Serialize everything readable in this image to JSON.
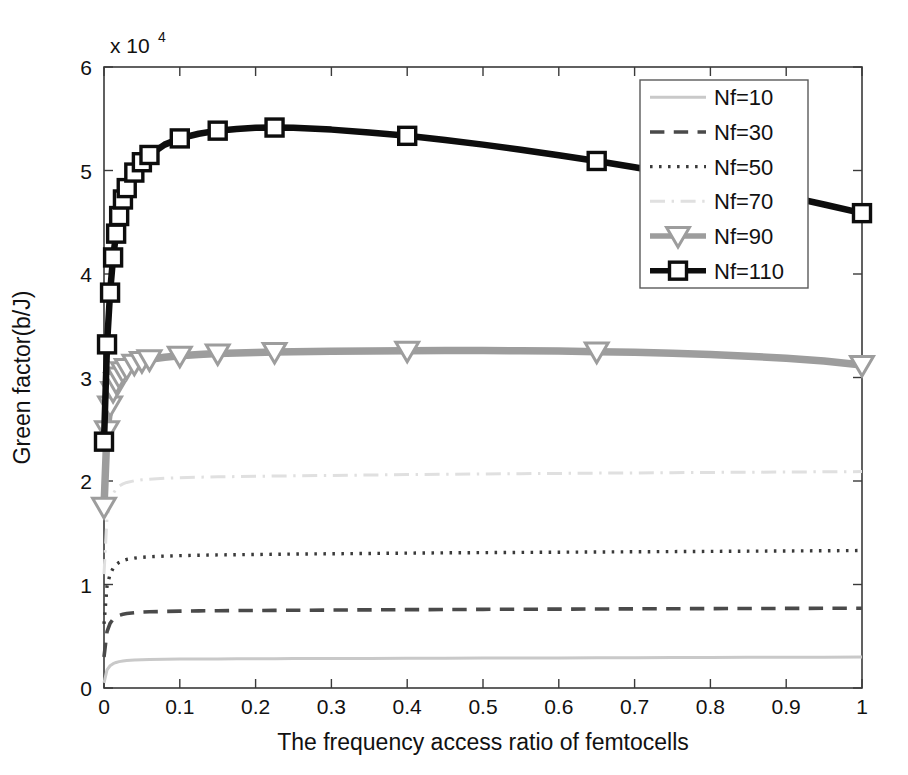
{
  "chart_data": {
    "type": "line",
    "title": "",
    "xlabel": "The frequency access ratio of femtocells",
    "ylabel": "Green factor(b/J)",
    "y_exponent_label": "x 10",
    "y_exponent_power": "4",
    "y_scale_factor": 10000,
    "xlim": [
      0,
      1
    ],
    "ylim": [
      0,
      6
    ],
    "xticks": [
      "0",
      "0.1",
      "0.2",
      "0.3",
      "0.4",
      "0.5",
      "0.6",
      "0.7",
      "0.8",
      "0.9",
      "1"
    ],
    "xtick_values": [
      0,
      0.1,
      0.2,
      0.3,
      0.4,
      0.5,
      0.6,
      0.7,
      0.8,
      0.9,
      1
    ],
    "yticks": [
      "0",
      "1",
      "2",
      "3",
      "4",
      "5",
      "6"
    ],
    "ytick_values": [
      0,
      1,
      2,
      3,
      4,
      5,
      6
    ],
    "grid": false,
    "legend_position": "upper right",
    "x": [
      0,
      0.004,
      0.008,
      0.012,
      0.016,
      0.02,
      0.025,
      0.03,
      0.04,
      0.05,
      0.06,
      0.08,
      0.1,
      0.125,
      0.15,
      0.175,
      0.2,
      0.225,
      0.25,
      0.3,
      0.35,
      0.4,
      0.45,
      0.5,
      0.55,
      0.6,
      0.65,
      0.7,
      0.75,
      0.8,
      0.85,
      0.9,
      0.95,
      1.0
    ],
    "series": [
      {
        "name": "Nf=10",
        "label": "Nf=10",
        "style": "solid",
        "color": "#c9c9c9",
        "width": 3.0,
        "marker": "none",
        "values": [
          0.05,
          0.175,
          0.215,
          0.235,
          0.247,
          0.255,
          0.261,
          0.265,
          0.27,
          0.273,
          0.275,
          0.277,
          0.279,
          0.28,
          0.281,
          0.282,
          0.283,
          0.283,
          0.284,
          0.285,
          0.286,
          0.287,
          0.288,
          0.289,
          0.29,
          0.291,
          0.292,
          0.293,
          0.294,
          0.295,
          0.296,
          0.297,
          0.298,
          0.299
        ]
      },
      {
        "name": "Nf=30",
        "label": "Nf=30",
        "style": "dashed",
        "color": "#4a4a4a",
        "width": 3.6,
        "marker": "none",
        "values": [
          0.3,
          0.545,
          0.625,
          0.665,
          0.688,
          0.702,
          0.713,
          0.72,
          0.728,
          0.733,
          0.736,
          0.74,
          0.743,
          0.745,
          0.747,
          0.748,
          0.749,
          0.75,
          0.751,
          0.753,
          0.755,
          0.757,
          0.758,
          0.76,
          0.761,
          0.762,
          0.763,
          0.765,
          0.766,
          0.767,
          0.768,
          0.769,
          0.77,
          0.771
        ]
      },
      {
        "name": "Nf=50",
        "label": "Nf=50",
        "style": "dotted",
        "color": "#3a3a3a",
        "width": 3.4,
        "marker": "none",
        "values": [
          0.62,
          0.985,
          1.098,
          1.158,
          1.192,
          1.213,
          1.231,
          1.242,
          1.255,
          1.263,
          1.268,
          1.274,
          1.279,
          1.283,
          1.286,
          1.288,
          1.29,
          1.292,
          1.294,
          1.297,
          1.3,
          1.303,
          1.306,
          1.308,
          1.31,
          1.312,
          1.314,
          1.316,
          1.318,
          1.32,
          1.322,
          1.324,
          1.326,
          1.328
        ]
      },
      {
        "name": "Nf=70",
        "label": "Nf=70",
        "style": "dashdot",
        "color": "#e0e0e0",
        "width": 3.0,
        "marker": "none",
        "values": [
          1.1,
          1.645,
          1.798,
          1.878,
          1.923,
          1.95,
          1.972,
          1.986,
          2.002,
          2.012,
          2.018,
          2.026,
          2.032,
          2.037,
          2.04,
          2.043,
          2.046,
          2.048,
          2.05,
          2.054,
          2.058,
          2.062,
          2.065,
          2.068,
          2.071,
          2.073,
          2.076,
          2.078,
          2.08,
          2.083,
          2.085,
          2.087,
          2.089,
          2.091
        ]
      },
      {
        "name": "Nf=90",
        "label": "Nf=90",
        "style": "solid",
        "color": "#9d9d9d",
        "width": 7.5,
        "marker": "triangle-down",
        "values": [
          1.75,
          2.49,
          2.73,
          2.87,
          2.955,
          3.01,
          3.06,
          3.092,
          3.133,
          3.158,
          3.175,
          3.196,
          3.21,
          3.222,
          3.231,
          3.237,
          3.242,
          3.246,
          3.249,
          3.254,
          3.257,
          3.259,
          3.26,
          3.26,
          3.258,
          3.255,
          3.25,
          3.243,
          3.234,
          3.222,
          3.206,
          3.186,
          3.16,
          3.12
        ]
      },
      {
        "name": "Nf=110",
        "label": "Nf=110",
        "style": "solid",
        "color": "#0d0d0d",
        "width": 6.5,
        "marker": "square",
        "values": [
          2.38,
          3.32,
          3.82,
          4.16,
          4.39,
          4.56,
          4.72,
          4.83,
          4.98,
          5.08,
          5.15,
          5.25,
          5.31,
          5.355,
          5.385,
          5.402,
          5.412,
          5.415,
          5.412,
          5.395,
          5.368,
          5.335,
          5.295,
          5.25,
          5.2,
          5.148,
          5.092,
          5.032,
          4.968,
          4.9,
          4.828,
          4.752,
          4.672,
          4.588
        ]
      }
    ]
  },
  "legend": {
    "entries": [
      "Nf=10",
      "Nf=30",
      "Nf=50",
      "Nf=70",
      "Nf=90",
      "Nf=110"
    ]
  },
  "axes": {
    "x_axis_title": "The frequency access ratio of femtocells",
    "y_axis_title": "Green factor(b/J)"
  }
}
